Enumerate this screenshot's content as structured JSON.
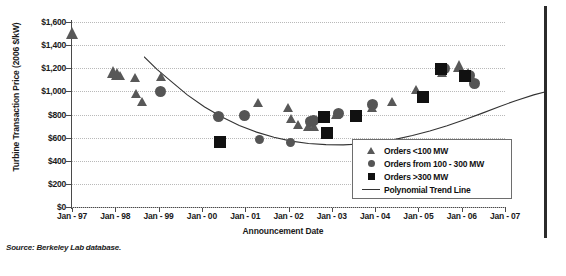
{
  "chart_data": {
    "type": "scatter",
    "title": "",
    "xlabel": "Announcement Date",
    "ylabel": "Turbine Transaction Price (2006 $/kW)",
    "ylim": [
      0,
      1600
    ],
    "ytick_labels": [
      "$1,600",
      "$1,400",
      "$1,200",
      "$1,000",
      "$800",
      "$600",
      "$400",
      "$200",
      "$0"
    ],
    "ytick_values": [
      1600,
      1400,
      1200,
      1000,
      800,
      600,
      400,
      200,
      0
    ],
    "xtick_labels": [
      "Jan - 97",
      "Jan - 98",
      "Jan - 99",
      "Jan - 00",
      "Jan - 01",
      "Jan - 02",
      "Jan - 03",
      "Jan - 04",
      "Jan - 05",
      "Jan - 06",
      "Jan - 07"
    ],
    "xtick_values": [
      1997.0,
      1998.0,
      1999.0,
      2000.0,
      2001.0,
      2002.0,
      2003.0,
      2004.0,
      2005.0,
      2006.0,
      2007.0
    ],
    "xlim": [
      1997.0,
      2007.0
    ],
    "grid": true,
    "legend_position": "bottom-right",
    "series": [
      {
        "name": "Orders <100 MW",
        "marker": "triangle",
        "color": "#585858",
        "points": [
          {
            "x": 1997.02,
            "y": 1495,
            "size": "big"
          },
          {
            "x": 1997.95,
            "y": 1155,
            "size": "big"
          },
          {
            "x": 1998.05,
            "y": 1140,
            "size": "big"
          },
          {
            "x": 1998.12,
            "y": 1130,
            "size": "small"
          },
          {
            "x": 1998.45,
            "y": 1110,
            "size": "small"
          },
          {
            "x": 1998.48,
            "y": 968,
            "size": "small"
          },
          {
            "x": 1998.62,
            "y": 900,
            "size": "small"
          },
          {
            "x": 1999.05,
            "y": 1115,
            "size": "small"
          },
          {
            "x": 2001.3,
            "y": 893,
            "size": "small"
          },
          {
            "x": 2001.98,
            "y": 855,
            "size": "small"
          },
          {
            "x": 2002.05,
            "y": 760,
            "size": "small"
          },
          {
            "x": 2002.22,
            "y": 700,
            "size": "small"
          },
          {
            "x": 2002.45,
            "y": 690,
            "size": "small"
          },
          {
            "x": 2002.6,
            "y": 690,
            "size": "small"
          },
          {
            "x": 2003.1,
            "y": 790,
            "size": "small"
          },
          {
            "x": 2003.92,
            "y": 855,
            "size": "small"
          },
          {
            "x": 2004.4,
            "y": 900,
            "size": "small"
          },
          {
            "x": 2004.95,
            "y": 1010,
            "size": "small"
          },
          {
            "x": 2005.55,
            "y": 1155,
            "size": "small"
          },
          {
            "x": 2005.95,
            "y": 1205,
            "size": "big"
          },
          {
            "x": 2006.15,
            "y": 1135,
            "size": "big"
          }
        ]
      },
      {
        "name": "Orders from 100 - 300 MW",
        "marker": "circle",
        "color": "#555555",
        "points": [
          {
            "x": 1999.05,
            "y": 1000,
            "size": "big"
          },
          {
            "x": 2000.38,
            "y": 785,
            "size": "big"
          },
          {
            "x": 2000.98,
            "y": 790,
            "size": "big"
          },
          {
            "x": 2001.32,
            "y": 585,
            "size": "small"
          },
          {
            "x": 2002.05,
            "y": 560,
            "size": "small"
          },
          {
            "x": 2002.5,
            "y": 740,
            "size": "big"
          },
          {
            "x": 2002.58,
            "y": 745,
            "size": "big"
          },
          {
            "x": 2003.15,
            "y": 805,
            "size": "big"
          },
          {
            "x": 2003.95,
            "y": 890,
            "size": "big"
          },
          {
            "x": 2005.6,
            "y": 1195,
            "size": "big"
          },
          {
            "x": 2006.18,
            "y": 1135,
            "size": "big"
          },
          {
            "x": 2006.3,
            "y": 1070,
            "size": "big"
          }
        ]
      },
      {
        "name": "Orders >300 MW",
        "marker": "square",
        "color": "#111111",
        "points": [
          {
            "x": 2000.42,
            "y": 560,
            "size": "big"
          },
          {
            "x": 2002.82,
            "y": 775,
            "size": "big"
          },
          {
            "x": 2002.88,
            "y": 640,
            "size": "big"
          },
          {
            "x": 2003.55,
            "y": 785,
            "size": "big"
          },
          {
            "x": 2005.1,
            "y": 955,
            "size": "big"
          },
          {
            "x": 2005.52,
            "y": 1190,
            "size": "big"
          },
          {
            "x": 2006.08,
            "y": 1130,
            "size": "big"
          }
        ]
      }
    ],
    "trend_line": {
      "name": "Polynomial Trend Line",
      "color": "#333333",
      "points": [
        {
          "x": 1997.0,
          "y": 1490
        },
        {
          "x": 1997.3,
          "y": 1380
        },
        {
          "x": 1997.6,
          "y": 1285
        },
        {
          "x": 1998.0,
          "y": 1160
        },
        {
          "x": 1998.4,
          "y": 1055
        },
        {
          "x": 1998.8,
          "y": 968
        },
        {
          "x": 1999.2,
          "y": 895
        },
        {
          "x": 1999.6,
          "y": 838
        },
        {
          "x": 2000.0,
          "y": 793
        },
        {
          "x": 2000.4,
          "y": 760
        },
        {
          "x": 2000.8,
          "y": 740
        },
        {
          "x": 2001.2,
          "y": 730
        },
        {
          "x": 2001.6,
          "y": 728
        },
        {
          "x": 2002.0,
          "y": 735
        },
        {
          "x": 2002.4,
          "y": 750
        },
        {
          "x": 2002.8,
          "y": 775
        },
        {
          "x": 2003.2,
          "y": 808
        },
        {
          "x": 2003.6,
          "y": 848
        },
        {
          "x": 2004.0,
          "y": 893
        },
        {
          "x": 2004.4,
          "y": 945
        },
        {
          "x": 2004.8,
          "y": 1000
        },
        {
          "x": 2005.2,
          "y": 1058
        },
        {
          "x": 2005.6,
          "y": 1112
        },
        {
          "x": 2006.0,
          "y": 1160
        },
        {
          "x": 2006.3,
          "y": 1190
        }
      ]
    }
  },
  "legend": {
    "items": [
      {
        "symbol": "triangle",
        "label": "Orders <100 MW"
      },
      {
        "symbol": "circle",
        "label": "Orders from 100 - 300 MW"
      },
      {
        "symbol": "square",
        "label": "Orders >300 MW"
      },
      {
        "symbol": "line",
        "label": "Polynomial Trend Line"
      }
    ]
  },
  "footer": {
    "source": "Source: Berkeley Lab database."
  }
}
